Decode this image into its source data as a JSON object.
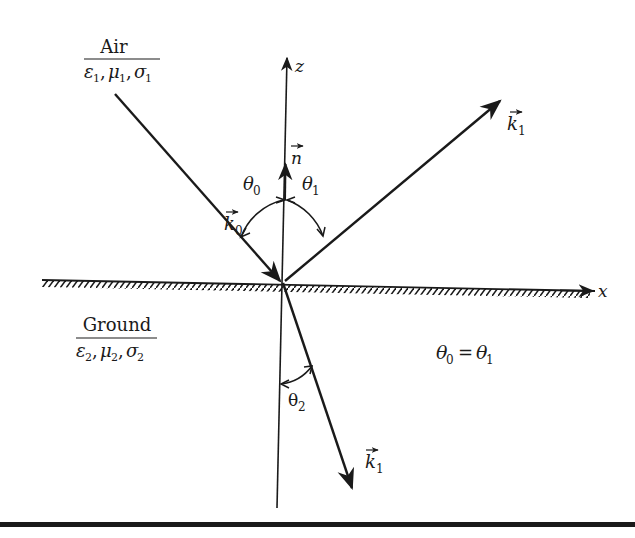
{
  "diagram": {
    "type": "reflection-refraction at air-ground interface",
    "media": {
      "upper": {
        "name": "Air",
        "params": "ε1, μ1, σ1",
        "eps": "ε",
        "mu": "μ",
        "sigma": "σ",
        "sub": "1"
      },
      "lower": {
        "name": "Ground",
        "params": "ε2, μ2, σ2",
        "eps": "ε",
        "mu": "μ",
        "sigma": "σ",
        "sub": "2"
      }
    },
    "axes": {
      "z": {
        "label": "z"
      },
      "x": {
        "label": "x"
      }
    },
    "vectors": {
      "normal": {
        "symbol": "n"
      },
      "incident": {
        "symbol": "k",
        "sub": "0"
      },
      "reflected": {
        "symbol": "k",
        "sub": "1"
      },
      "transmitted": {
        "symbol": "k",
        "sub": "1"
      }
    },
    "angles": {
      "incidence": {
        "symbol": "θ",
        "sub": "0"
      },
      "reflection": {
        "symbol": "θ",
        "sub": "1"
      },
      "refraction": {
        "symbol": "θ",
        "sub": "2"
      }
    },
    "relation": {
      "lhs_sym": "θ",
      "lhs_sub": "0",
      "op": "=",
      "rhs_sym": "θ",
      "rhs_sub": "1",
      "text": "θ0 = θ1"
    },
    "colors": {
      "ink": "#1a1a1a",
      "background": "#ffffff"
    }
  }
}
